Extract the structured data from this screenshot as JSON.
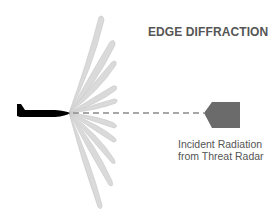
{
  "title": "EDGE DIFFRACTION",
  "caption": {
    "line1": "Incident Radiation",
    "line2": "from Threat Radar"
  },
  "colors": {
    "lobe_fill": "#d9d9d9",
    "lobe_stroke": "#c4c4c4",
    "aircraft": "#000000",
    "arrow": "#6b6b6b",
    "dashed_line": "#8a8a8a",
    "text": "#555555"
  },
  "elements": {
    "aircraft": "aircraft-silhouette",
    "arrow": "incident-radar-arrow",
    "lobes": "diffraction-lobes"
  }
}
